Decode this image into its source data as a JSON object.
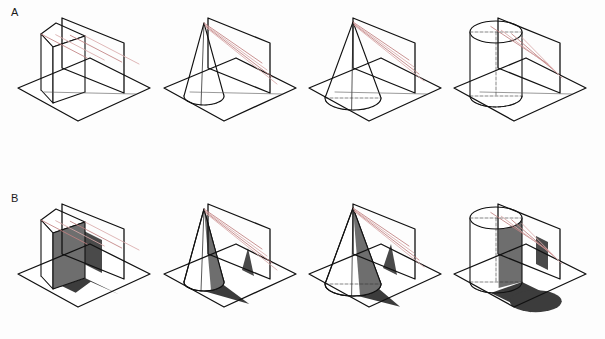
{
  "figure": {
    "type": "geometric-projection-diagram",
    "panels": [
      {
        "id": "A",
        "label": "A",
        "label_x": 11,
        "label_y": 6,
        "shadows_filled": false,
        "row_origin_y": 0
      },
      {
        "id": "B",
        "label": "B",
        "label_x": 11,
        "label_y": 192,
        "shadows_filled": true,
        "row_origin_y": 186
      }
    ],
    "columns": [
      {
        "index": 0,
        "solid": "rectangular-prism",
        "origin_x": 14
      },
      {
        "index": 1,
        "solid": "narrow-cone",
        "origin_x": 160
      },
      {
        "index": 2,
        "solid": "wide-cone",
        "origin_x": 305
      },
      {
        "index": 3,
        "solid": "cylinder",
        "origin_x": 450
      }
    ],
    "colors": {
      "outline": "#111111",
      "ray": "#bf7f7f",
      "ray_light": "#d9aaaa",
      "hidden_edge": "#333333",
      "shadow_ground": "#3c3c3c",
      "shadow_plane": "#4a4a4a",
      "solid_face_shaded": "#6e6e6e",
      "solid_face_light": "#ffffff",
      "background": "#fdfdfd"
    },
    "geometry": {
      "ground_plane": {
        "shape": "parallelogram",
        "left": [
          4,
          88
        ],
        "top": [
          76,
          58
        ],
        "right": [
          136,
          88
        ],
        "bottom": [
          64,
          121
        ]
      },
      "vertical_plane": {
        "shape": "parallelogram",
        "top_left": [
          48,
          18
        ],
        "top_right": [
          110,
          43
        ],
        "bottom_right": [
          110,
          93
        ],
        "bottom_left": [
          48,
          68
        ]
      },
      "prism": {
        "base_cx": 44,
        "base_cy": 93,
        "half_w": 17,
        "half_d": 9,
        "height": 56
      },
      "narrow_cone": {
        "base_cx": 44,
        "base_cy": 96,
        "rx": 20,
        "ry": 9,
        "apex_x": 44,
        "apex_y": 23
      },
      "wide_cone": {
        "base_cx": 48,
        "base_cy": 98,
        "rx": 28,
        "ry": 12,
        "apex_x": 48,
        "apex_y": 22
      },
      "cylinder": {
        "base_cx": 46,
        "base_cy": 96,
        "rx": 26,
        "ry": 11,
        "height": 64
      }
    },
    "ray_count": 4
  }
}
